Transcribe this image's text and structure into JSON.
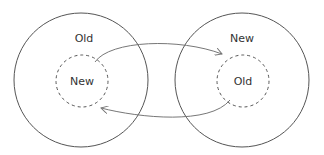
{
  "left_circle": {
    "outer_label": "Old",
    "inner_label": "New"
  },
  "right_circle": {
    "outer_label": "New",
    "inner_label": "Old"
  },
  "colors": {
    "stroke": "#555555",
    "text": "#333333",
    "arrow": "#777777"
  }
}
